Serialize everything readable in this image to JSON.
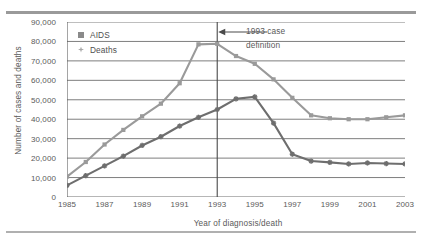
{
  "chart_data": {
    "type": "line",
    "title": "",
    "xlabel": "Year of diagnosis/death",
    "ylabel": "Number of cases and deaths",
    "x": [
      1985,
      1986,
      1987,
      1988,
      1989,
      1990,
      1991,
      1992,
      1993,
      1994,
      1995,
      1996,
      1997,
      1998,
      1999,
      2000,
      2001,
      2002,
      2003
    ],
    "xtick_labels": [
      "1985",
      "1987",
      "1989",
      "1991",
      "1993",
      "1995",
      "1997",
      "1999",
      "2001",
      "2003"
    ],
    "ytick_labels": [
      "0",
      "10,000",
      "20,000",
      "30,000",
      "40,000",
      "50,000",
      "60,000",
      "70,000",
      "80,000",
      "90,000"
    ],
    "ylim": [
      0,
      90000
    ],
    "xlim": [
      1985,
      2003
    ],
    "grid": true,
    "legend_position": "top-left",
    "series": [
      {
        "name": "AIDS",
        "marker": "square",
        "color": "#9a9a9a",
        "values": [
          10500,
          18000,
          27000,
          34500,
          41500,
          48000,
          58500,
          78500,
          78800,
          72500,
          68500,
          60500,
          51000,
          42000,
          40500,
          40000,
          40000,
          41000,
          42000
        ]
      },
      {
        "name": "Deaths",
        "marker": "x-star",
        "color": "#6e6e6e",
        "values": [
          6000,
          11000,
          16000,
          21000,
          26500,
          31000,
          36500,
          41000,
          45000,
          50500,
          51500,
          38000,
          22000,
          18500,
          17800,
          17000,
          17500,
          17200,
          17000
        ]
      }
    ],
    "annotations": [
      {
        "name": "1993-case-definition",
        "text_line1": "1993 case",
        "text_line2": "definition",
        "marker_year": 1993,
        "type": "vertical-line-with-arrow"
      }
    ]
  },
  "legend": {
    "items": [
      {
        "label": "AIDS",
        "swatch": "square-marker-icon"
      },
      {
        "label": "Deaths",
        "swatch": "star-marker-icon"
      }
    ]
  },
  "axes": {
    "x_title": "Year of diagnosis/death",
    "y_title": "Number of cases and deaths"
  }
}
